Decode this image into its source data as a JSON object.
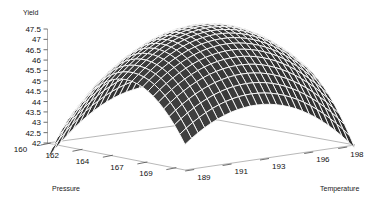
{
  "chart_data": {
    "type": "surface",
    "title": "",
    "zlabel": "Yield",
    "xlabel": "Pressure",
    "ylabel": "Temperature",
    "z_ticks": [
      "47.5",
      "47",
      "46.5",
      "46",
      "45.5",
      "45",
      "44.5",
      "44",
      "43.5",
      "43",
      "42.5",
      "42"
    ],
    "z_tick_values": [
      47.5,
      47,
      46.5,
      46,
      45.5,
      45,
      44.5,
      44,
      43.5,
      43,
      42.5,
      42
    ],
    "zlim": [
      42,
      47.5
    ],
    "x_ticks": [
      "160",
      "162",
      "164",
      "167",
      "169"
    ],
    "x_tick_values": [
      160,
      162,
      164,
      167,
      169
    ],
    "xlim": [
      160,
      170
    ],
    "y_ticks": [
      "189",
      "191",
      "193",
      "196",
      "198"
    ],
    "y_tick_values": [
      189,
      191,
      193,
      196,
      198
    ],
    "ylim": [
      188,
      199
    ],
    "grid": false,
    "legend": false,
    "surface_style": "wireframe-mesh-dark",
    "surface_fill_color": "#3a3a3a",
    "surface_line_color": "#ffffff",
    "background_color": "#ffffff",
    "model": {
      "form": "quadratic",
      "z_max": 47.8,
      "z_min": 42.0,
      "x_at_max": 165.2,
      "y_at_max": 193.5
    },
    "grid_rows": 26,
    "grid_cols": 26,
    "surface_values_note": "Yield sampled on a 5x5 grid over Pressure x Temperature",
    "sample_grid": {
      "pressure": [
        160,
        162.5,
        165,
        167.5,
        170
      ],
      "temperature": [
        188,
        190.75,
        193.5,
        196.25,
        199
      ],
      "yield": [
        [
          44.6,
          45.4,
          45.7,
          45.5,
          44.8
        ],
        [
          45.8,
          46.7,
          47.0,
          46.8,
          46.1
        ],
        [
          46.4,
          47.4,
          47.8,
          47.6,
          46.9
        ],
        [
          46.2,
          47.2,
          47.6,
          47.4,
          46.7
        ],
        [
          45.2,
          46.2,
          46.6,
          46.4,
          45.7
        ]
      ]
    }
  },
  "axes": {
    "z": {
      "title": "Yield",
      "ticks": [
        "47.5",
        "47",
        "46.5",
        "46",
        "45.5",
        "45",
        "44.5",
        "44",
        "43.5",
        "43",
        "42.5",
        "42"
      ]
    },
    "x": {
      "title": "Pressure",
      "ticks": [
        "160",
        "162",
        "164",
        "167",
        "169"
      ]
    },
    "y": {
      "title": "Temperature",
      "ticks": [
        "189",
        "191",
        "193",
        "196",
        "198"
      ]
    }
  }
}
